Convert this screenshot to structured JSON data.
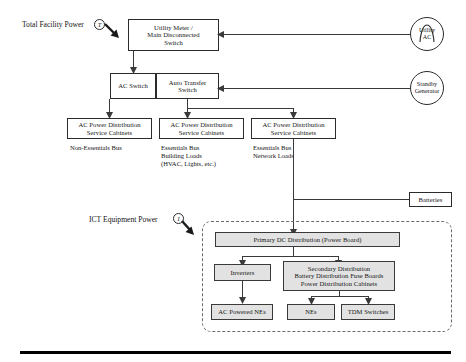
{
  "diagram": {
    "annotations": {
      "total_facility_power": "Total Facility Power",
      "total_facility_power_tag": "T",
      "ict_equipment_power": "ICT Equipment Power",
      "ict_equipment_power_tag": "I"
    },
    "sources": [
      {
        "id": "utility-ac",
        "line1": "Utility",
        "line2": "AC"
      },
      {
        "id": "standby-generator",
        "line1": "Standby",
        "line2": "Generator"
      }
    ],
    "boxes": {
      "utility_meter": {
        "line1": "Utility Meter /",
        "line2": "Main Disconnected",
        "line3": "Switch"
      },
      "ac_switch": {
        "line1": "AC Switch"
      },
      "auto_transfer_switch": {
        "line1": "Auto Transfer",
        "line2": "Switch"
      },
      "cabinet_1": {
        "line1": "AC Power Distribution",
        "line2": "Service Cabinets"
      },
      "cabinet_2": {
        "line1": "AC Power Distribution",
        "line2": "Service Cabinets"
      },
      "cabinet_3": {
        "line1": "AC Power Distribution",
        "line2": "Service Cabinets"
      },
      "batteries": {
        "line1": "Batteries"
      },
      "primary_dc": {
        "line1": "Primary DC Distribution (Power Board)"
      },
      "inverters": {
        "line1": "Inverters"
      },
      "secondary_distribution": {
        "line1": "Secondary Distribution",
        "line2": "Battery Distribution Fuse Boards",
        "line3": "Power Distribution Cabinets"
      },
      "ac_powered_nes": {
        "line1": "AC Powered NEs"
      },
      "nes": {
        "line1": "NEs"
      },
      "tdm_switches": {
        "line1": "TDM Switches"
      }
    },
    "bus_labels": {
      "non_essentials": "Non-Essentials Bus",
      "essentials_building": "Essentials Bus\nBuilding Loads\n(HVAC, Lights, etc.)",
      "essentials_network": "Essentials Bus\nNetwork Loads"
    },
    "colors": {
      "stroke": "#2b2b2b",
      "shaded_fill": "#e2e2e2",
      "dashed_stroke": "#6a6a6a",
      "background": "#ffffff",
      "footer_rule": "#000000"
    }
  }
}
